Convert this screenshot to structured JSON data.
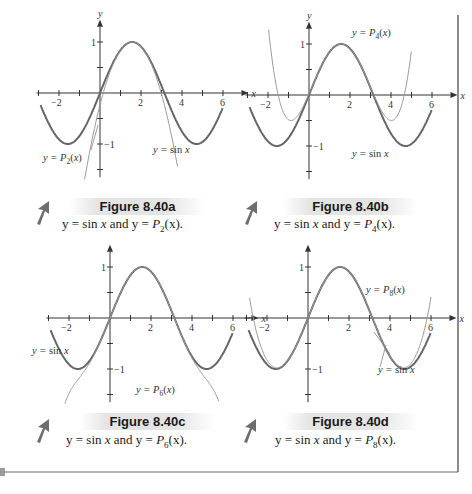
{
  "chart_data": [
    {
      "type": "line",
      "panel": "a",
      "title": "Figure 8.40a",
      "caption": "y = sin x and y = P2(x).",
      "xlabel": "x",
      "ylabel": "y",
      "xticks": [
        -2,
        2,
        4,
        6
      ],
      "yticks": [
        1,
        -1
      ],
      "xlim": [
        -3,
        6.5
      ],
      "ylim": [
        -1.6,
        1.3
      ],
      "series": [
        {
          "name": "y = sin x",
          "function": "sin",
          "x_range": [
            -2.9,
            6.0
          ],
          "style": "dark"
        },
        {
          "name": "y = P2(x)",
          "function": "taylor_sin_order_2",
          "x_range": [
            -0.75,
            3.8
          ],
          "style": "light"
        }
      ],
      "annotations": [
        {
          "text": "y = P2(x)",
          "anchor": "lower-left"
        },
        {
          "text": "y = sin x",
          "anchor": "lower-right"
        }
      ]
    },
    {
      "type": "line",
      "panel": "b",
      "title": "Figure 8.40b",
      "caption": "y = sin x and y = P4(x).",
      "xlabel": "x",
      "ylabel": "y",
      "xticks": [
        -2,
        2,
        4,
        6
      ],
      "yticks": [
        1,
        -1
      ],
      "xlim": [
        -3,
        6.5
      ],
      "ylim": [
        -1.6,
        1.3
      ],
      "series": [
        {
          "name": "y = sin x",
          "function": "sin",
          "x_range": [
            -2.9,
            6.0
          ],
          "style": "dark"
        },
        {
          "name": "y = P4(x)",
          "function": "taylor_sin_order_4_about_pi_over_2_shifted",
          "x_range": [
            -2.0,
            5.0
          ],
          "style": "light"
        }
      ],
      "annotations": [
        {
          "text": "y = P4(x)",
          "anchor": "upper-right"
        },
        {
          "text": "y = sin x",
          "anchor": "lower-right"
        }
      ]
    },
    {
      "type": "line",
      "panel": "c",
      "title": "Figure 8.40c",
      "caption": "y = sin x and y = P6(x).",
      "xlabel": "x",
      "ylabel": "y",
      "xticks": [
        -2,
        2,
        4,
        6
      ],
      "yticks": [
        1,
        -1
      ],
      "xlim": [
        -3,
        6.5
      ],
      "ylim": [
        -1.6,
        1.3
      ],
      "series": [
        {
          "name": "y = sin x",
          "function": "sin",
          "x_range": [
            -2.9,
            6.0
          ],
          "style": "dark"
        },
        {
          "name": "y = P6(x)",
          "function": "taylor_sin_order_6",
          "x_range": [
            -2.2,
            5.3
          ],
          "style": "light"
        }
      ],
      "annotations": [
        {
          "text": "y = sin x",
          "anchor": "left"
        },
        {
          "text": "y = P6(x)",
          "anchor": "lower-right"
        }
      ]
    },
    {
      "type": "line",
      "panel": "d",
      "title": "Figure 8.40d",
      "caption": "y = sin x and y = P8(x).",
      "xlabel": "x",
      "ylabel": "y",
      "xticks": [
        -2,
        2,
        4,
        6
      ],
      "yticks": [
        1,
        -1
      ],
      "xlim": [
        -3,
        6.5
      ],
      "ylim": [
        -1.6,
        1.3
      ],
      "series": [
        {
          "name": "y = sin x",
          "function": "sin",
          "x_range": [
            -2.9,
            6.0
          ],
          "style": "dark"
        },
        {
          "name": "y = P8(x)",
          "function": "taylor_sin_order_8",
          "x_range": [
            -2.85,
            6.0
          ],
          "style": "light"
        }
      ],
      "annotations": [
        {
          "text": "y = P8(x)",
          "anchor": "upper-right"
        },
        {
          "text": "y = sin x",
          "anchor": "lower-right"
        }
      ]
    }
  ],
  "figures": [
    {
      "id": "a",
      "title": "Figure 8.40a",
      "caption_pre": "y = sin ",
      "caption_x": "x",
      "caption_mid": " and y = ",
      "caption_P": "P",
      "caption_sub": "2",
      "caption_post": "(x)."
    },
    {
      "id": "b",
      "title": "Figure 8.40b",
      "caption_pre": "y = sin ",
      "caption_x": "x",
      "caption_mid": " and y = ",
      "caption_P": "P",
      "caption_sub": "4",
      "caption_post": "(x)."
    },
    {
      "id": "c",
      "title": "Figure 8.40c",
      "caption_pre": "y = sin ",
      "caption_x": "x",
      "caption_mid": " and y = ",
      "caption_P": "P",
      "caption_sub": "6",
      "caption_post": "(x)."
    },
    {
      "id": "d",
      "title": "Figure 8.40d",
      "caption_pre": "y = sin ",
      "caption_x": "x",
      "caption_mid": " and y = ",
      "caption_P": "P",
      "caption_sub": "8",
      "caption_post": "(x)."
    }
  ],
  "colors": {
    "sin_curve": "#666666",
    "poly_curve": "#9a9a9a",
    "axis": "#333333",
    "arrow_icon": "#6e6e6e",
    "border": "#666666"
  }
}
